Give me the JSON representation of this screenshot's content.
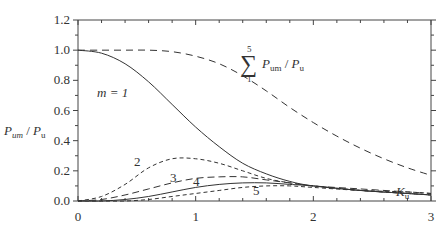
{
  "chart_data": {
    "type": "line",
    "title": "",
    "xlabel": "K_u",
    "ylabel": "P_um / P_u",
    "xlim": [
      0,
      3
    ],
    "ylim": [
      0,
      1.2
    ],
    "grid": false,
    "x_ticks": [
      "0",
      "1",
      "2",
      "3"
    ],
    "y_ticks": [
      "0.0",
      "0.2",
      "0.4",
      "0.6",
      "0.8",
      "1.0",
      "1.2"
    ],
    "series": [
      {
        "name": "m = 1",
        "style": "solid",
        "x": [
          0,
          0.2,
          0.4,
          0.6,
          0.8,
          1.0,
          1.2,
          1.4,
          1.6,
          1.8,
          2.0,
          2.4,
          2.8,
          3.0
        ],
        "y": [
          1.0,
          0.98,
          0.91,
          0.79,
          0.64,
          0.49,
          0.36,
          0.25,
          0.18,
          0.13,
          0.1,
          0.07,
          0.05,
          0.04
        ]
      },
      {
        "name": "2",
        "style": "dashed",
        "x": [
          0,
          0.2,
          0.4,
          0.6,
          0.8,
          1.0,
          1.2,
          1.4,
          1.6,
          1.8,
          2.0,
          2.4,
          2.8,
          3.0
        ],
        "y": [
          0.0,
          0.03,
          0.11,
          0.22,
          0.28,
          0.28,
          0.25,
          0.2,
          0.15,
          0.12,
          0.1,
          0.07,
          0.05,
          0.04
        ]
      },
      {
        "name": "3",
        "style": "dashed",
        "x": [
          0,
          0.2,
          0.4,
          0.6,
          0.8,
          1.0,
          1.2,
          1.4,
          1.6,
          1.8,
          2.0,
          2.4,
          2.8,
          3.0
        ],
        "y": [
          0.0,
          0.01,
          0.04,
          0.08,
          0.12,
          0.15,
          0.16,
          0.16,
          0.14,
          0.12,
          0.1,
          0.08,
          0.06,
          0.05
        ]
      },
      {
        "name": "4",
        "style": "solid",
        "x": [
          0,
          0.2,
          0.4,
          0.6,
          0.8,
          1.0,
          1.2,
          1.4,
          1.6,
          1.8,
          2.0,
          2.4,
          2.8,
          3.0
        ],
        "y": [
          0.0,
          0.0,
          0.01,
          0.03,
          0.06,
          0.09,
          0.11,
          0.12,
          0.12,
          0.11,
          0.1,
          0.07,
          0.05,
          0.04
        ]
      },
      {
        "name": "5",
        "style": "dashed",
        "x": [
          0,
          0.2,
          0.4,
          0.6,
          0.8,
          1.0,
          1.2,
          1.4,
          1.6,
          1.8,
          2.0,
          2.4,
          2.8,
          3.0
        ],
        "y": [
          0.0,
          0.0,
          0.0,
          0.01,
          0.03,
          0.05,
          0.07,
          0.09,
          0.1,
          0.1,
          0.09,
          0.07,
          0.06,
          0.05
        ]
      },
      {
        "name": "Σ(1..5) P_um/P_u",
        "style": "dashed",
        "x": [
          0,
          0.2,
          0.4,
          0.6,
          0.8,
          1.0,
          1.2,
          1.4,
          1.6,
          1.8,
          2.0,
          2.2,
          2.4,
          2.6,
          2.8,
          3.0
        ],
        "y": [
          1.0,
          1.0,
          1.0,
          1.0,
          0.99,
          0.96,
          0.91,
          0.83,
          0.73,
          0.62,
          0.52,
          0.43,
          0.35,
          0.28,
          0.22,
          0.17
        ]
      }
    ],
    "annotations": [
      "m = 1",
      "2",
      "3",
      "4",
      "5",
      "Σ (m=1..5) P_um / P_u"
    ]
  },
  "labels": {
    "ylabel_main": "P",
    "ylabel_sub": "um",
    "ylabel_div": " / ",
    "ylabel_main2": "P",
    "ylabel_sub2": "u",
    "xlabel_main": "K",
    "xlabel_sub": "u",
    "m1": "m = 1",
    "c2": "2",
    "c3": "3",
    "c4": "4",
    "c5": "5",
    "sum_symbol": "∑",
    "sum_upper": "5",
    "sum_lower": "1",
    "sum_text_main": "P",
    "sum_text_sub": "um",
    "sum_text_div": " / ",
    "sum_text_main2": "P",
    "sum_text_sub2": "u"
  }
}
